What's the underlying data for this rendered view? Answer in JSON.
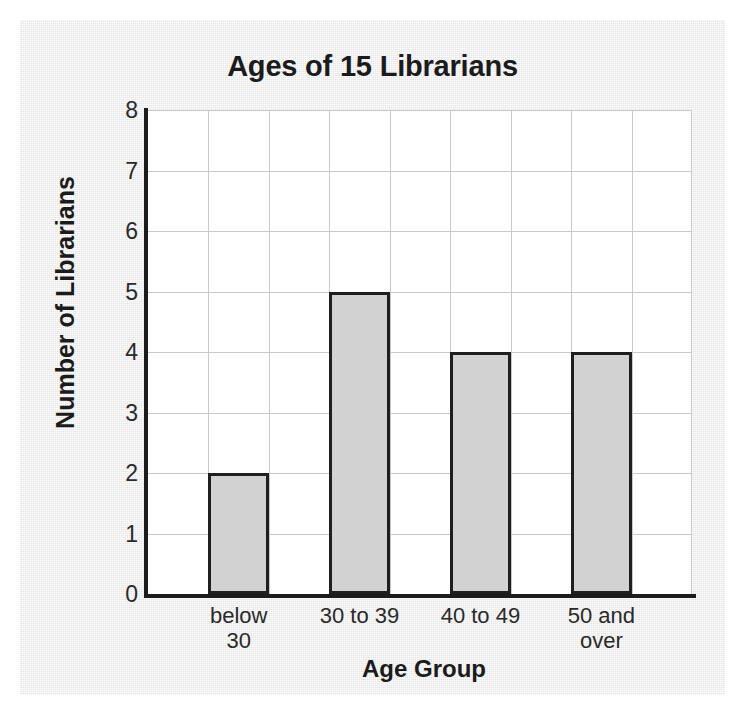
{
  "chart_data": {
    "type": "bar",
    "title": "Ages of 15 Librarians",
    "xlabel": "Age Group",
    "ylabel": "Number of Librarians",
    "categories": [
      "below 30",
      "30 to 39",
      "40 to 49",
      "50 and over"
    ],
    "category_lines": [
      [
        "below",
        "30"
      ],
      [
        "30 to 39"
      ],
      [
        "40 to 49"
      ],
      [
        "50 and",
        "over"
      ]
    ],
    "values": [
      2,
      5,
      4,
      4
    ],
    "ylim": [
      0,
      8
    ],
    "yticks": [
      0,
      1,
      2,
      3,
      4,
      5,
      6,
      7,
      8
    ],
    "ytick_labels": [
      "0",
      "1",
      "2",
      "3",
      "4",
      "5",
      "6",
      "7",
      "8"
    ],
    "grid": true,
    "legend": null,
    "bar_fill_color": "#d2d2d2",
    "bar_edge_color": "#1f1f1f",
    "gridline_color": "#c9c9c9",
    "axis_color": "#1c1c1c",
    "plot_background": "#ffffff",
    "paper_background": "#ececec"
  }
}
